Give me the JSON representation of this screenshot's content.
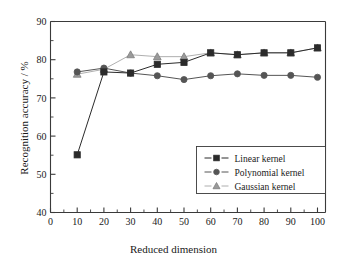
{
  "chart_data": {
    "type": "line",
    "title": "",
    "xlabel": "Reduced dimension",
    "ylabel": "Recognition accuracy / %",
    "x": [
      10,
      20,
      30,
      40,
      50,
      60,
      70,
      80,
      90,
      100
    ],
    "xlim": [
      0,
      103
    ],
    "ylim": [
      40,
      90
    ],
    "xticks": [
      0,
      10,
      20,
      30,
      40,
      50,
      60,
      70,
      80,
      90,
      100
    ],
    "yticks": [
      40,
      50,
      60,
      70,
      80,
      90
    ],
    "y_minor_step": 5,
    "grid": false,
    "legend_position": "lower-right",
    "series": [
      {
        "name": "Linear kernel",
        "marker": "square",
        "color": "#2b2b2b",
        "values": [
          55.1,
          76.8,
          76.5,
          78.8,
          79.3,
          81.8,
          81.3,
          81.8,
          81.8,
          83.1
        ]
      },
      {
        "name": "Polynomial kernel",
        "marker": "circle",
        "color": "#555555",
        "values": [
          76.8,
          77.8,
          76.5,
          75.8,
          74.8,
          75.8,
          76.3,
          75.9,
          75.9,
          75.4
        ]
      },
      {
        "name": "Gaussian kernel",
        "marker": "triangle",
        "color": "#9a9a9a",
        "values": [
          76.2,
          77.5,
          81.3,
          80.8,
          80.8,
          81.8,
          81.3,
          81.8,
          81.8,
          83.1
        ]
      }
    ]
  },
  "axes": {
    "xtick_labels": [
      "0",
      "10",
      "20",
      "30",
      "40",
      "50",
      "60",
      "70",
      "80",
      "90",
      "100"
    ],
    "ytick_labels": [
      "40",
      "50",
      "60",
      "70",
      "80",
      "90"
    ]
  },
  "legend": {
    "entries": [
      {
        "label": "Linear kernel"
      },
      {
        "label": "Polynomial kernel"
      },
      {
        "label": "Gaussian kernel"
      }
    ]
  }
}
